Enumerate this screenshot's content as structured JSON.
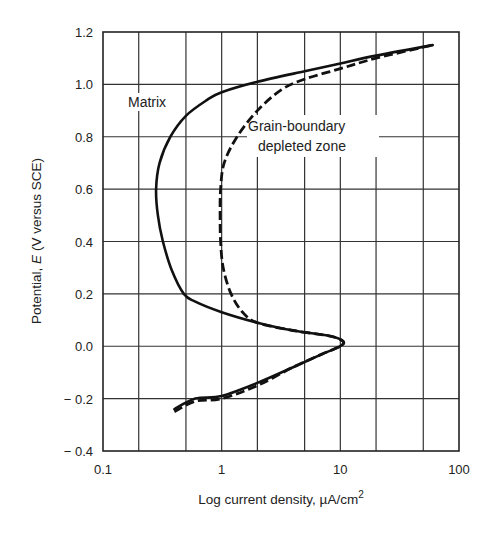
{
  "chart_data": {
    "type": "line",
    "title": "",
    "xlabel": "Log current density, µA/cm²",
    "xlabel_parts": {
      "main": "Log current density, µA/cm",
      "sup": "2"
    },
    "ylabel": "Potential, E (V versus SCE)",
    "ylabel_parts": {
      "prefix": "Potential, ",
      "italic": "E",
      "suffix": " (V versus SCE)"
    },
    "xscale": "log",
    "xlim": [
      0.1,
      100
    ],
    "ylim": [
      -0.4,
      1.2
    ],
    "grid": true,
    "x_ticks": [
      {
        "value": 0.1,
        "label": "0.1"
      },
      {
        "value": 1,
        "label": "1"
      },
      {
        "value": 10,
        "label": "10"
      },
      {
        "value": 100,
        "label": "100"
      }
    ],
    "x_gridlines": [
      0.2,
      0.5,
      1,
      2,
      5,
      10,
      20,
      50
    ],
    "y_ticks": [
      {
        "value": 1.2,
        "label": "1.2"
      },
      {
        "value": 1.0,
        "label": "1.0"
      },
      {
        "value": 0.8,
        "label": "0.8"
      },
      {
        "value": 0.6,
        "label": "0.6"
      },
      {
        "value": 0.4,
        "label": "0.4"
      },
      {
        "value": 0.2,
        "label": "0.2"
      },
      {
        "value": 0.0,
        "label": "0.0"
      },
      {
        "value": -0.2,
        "label": "− 0.2"
      },
      {
        "value": -0.4,
        "label": "− 0.4"
      }
    ],
    "series": [
      {
        "name": "Matrix",
        "style": "solid",
        "points": [
          [
            0.4,
            -0.24
          ],
          [
            0.6,
            -0.2
          ],
          [
            1.0,
            -0.19
          ],
          [
            2.0,
            -0.14
          ],
          [
            4.0,
            -0.08
          ],
          [
            7.0,
            -0.03
          ],
          [
            10.0,
            0.0
          ],
          [
            10.5,
            0.02
          ],
          [
            8.0,
            0.04
          ],
          [
            4.0,
            0.06
          ],
          [
            2.0,
            0.09
          ],
          [
            1.0,
            0.13
          ],
          [
            0.6,
            0.17
          ],
          [
            0.48,
            0.2
          ],
          [
            0.38,
            0.29
          ],
          [
            0.32,
            0.4
          ],
          [
            0.29,
            0.5
          ],
          [
            0.28,
            0.6
          ],
          [
            0.3,
            0.7
          ],
          [
            0.37,
            0.8
          ],
          [
            0.5,
            0.88
          ],
          [
            0.75,
            0.94
          ],
          [
            1.0,
            0.97
          ],
          [
            2.0,
            1.01
          ],
          [
            5.0,
            1.05
          ],
          [
            10.0,
            1.08
          ],
          [
            20.0,
            1.11
          ],
          [
            60.0,
            1.15
          ]
        ]
      },
      {
        "name": "Grain-boundary depleted zone",
        "style": "dashed",
        "points": [
          [
            0.4,
            -0.25
          ],
          [
            0.6,
            -0.21
          ],
          [
            1.0,
            -0.2
          ],
          [
            2.0,
            -0.15
          ],
          [
            4.0,
            -0.08
          ],
          [
            7.0,
            -0.03
          ],
          [
            10.0,
            0.0
          ],
          [
            10.5,
            0.02
          ],
          [
            8.0,
            0.04
          ],
          [
            4.0,
            0.06
          ],
          [
            2.0,
            0.09
          ],
          [
            1.5,
            0.13
          ],
          [
            1.2,
            0.2
          ],
          [
            1.03,
            0.3
          ],
          [
            0.98,
            0.4
          ],
          [
            0.97,
            0.5
          ],
          [
            0.98,
            0.6
          ],
          [
            1.05,
            0.7
          ],
          [
            1.35,
            0.8
          ],
          [
            2.0,
            0.9
          ],
          [
            3.2,
            0.98
          ],
          [
            5.0,
            1.02
          ],
          [
            10.0,
            1.06
          ],
          [
            20.0,
            1.1
          ],
          [
            60.0,
            1.15
          ]
        ]
      }
    ],
    "annotations": [
      {
        "text": "Matrix",
        "at": [
          0.22,
          0.93
        ]
      },
      {
        "text": "Grain-boundary",
        "at": [
          2.3,
          0.85
        ]
      },
      {
        "text": "depleted zone",
        "at": [
          2.6,
          0.77
        ]
      }
    ]
  },
  "labels": {
    "matrix": "Matrix",
    "gb_line1": "Grain-boundary",
    "gb_line2": "depleted zone"
  }
}
